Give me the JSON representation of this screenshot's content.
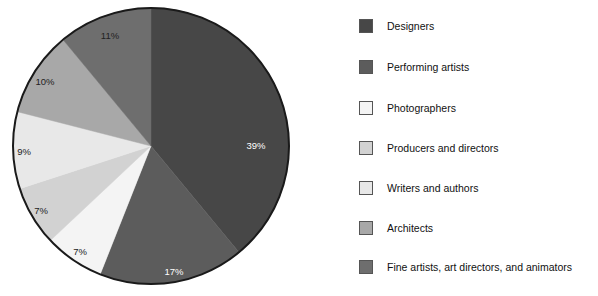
{
  "chart_data": {
    "type": "pie",
    "title": "",
    "subtitle": "",
    "xlabel": "",
    "ylabel": "",
    "legend_position": "right",
    "grid": false,
    "start_angle_deg": 0,
    "direction": "clockwise",
    "categories": [
      "Designers",
      "Performing artists",
      "Photographers",
      "Producers and directors",
      "Writers and authors",
      "Architects",
      "Fine artists, art directors, and animators"
    ],
    "values": [
      39,
      17,
      7,
      7,
      9,
      10,
      11
    ],
    "value_labels": [
      "39%",
      "17%",
      "7%",
      "7%",
      "9%",
      "10%",
      "11%"
    ],
    "colors": [
      "#474747",
      "#5c5c5c",
      "#f4f4f4",
      "#d2d2d2",
      "#e8e8e8",
      "#a8a8a8",
      "#6e6e6e"
    ],
    "label_colors": [
      "#ffffff",
      "#ffffff",
      "#222222",
      "#222222",
      "#222222",
      "#222222",
      "#222222"
    ]
  },
  "pie": {
    "outline_color": "#1a1a1a",
    "slices": [
      {
        "label": "Designers",
        "value": 39,
        "display": "39%",
        "color": "#474747",
        "text_color": "#ffffff",
        "label_x": 256,
        "label_y": 146
      },
      {
        "label": "Performing artists",
        "value": 17,
        "display": "17%",
        "color": "#5c5c5c",
        "text_color": "#ffffff",
        "label_x": 174,
        "label_y": 272
      },
      {
        "label": "Photographers",
        "value": 7,
        "display": "7%",
        "color": "#f4f4f4",
        "text_color": "#222222",
        "label_x": 80,
        "label_y": 252
      },
      {
        "label": "Producers and directors",
        "value": 7,
        "display": "7%",
        "color": "#d2d2d2",
        "text_color": "#222222",
        "label_x": 41,
        "label_y": 211
      },
      {
        "label": "Writers and authors",
        "value": 9,
        "display": "9%",
        "color": "#e8e8e8",
        "text_color": "#222222",
        "label_x": 24,
        "label_y": 152
      },
      {
        "label": "Architects",
        "value": 10,
        "display": "10%",
        "color": "#a8a8a8",
        "text_color": "#222222",
        "label_x": 45,
        "label_y": 82
      },
      {
        "label": "Fine artists, art directors, and animators",
        "value": 11,
        "display": "11%",
        "color": "#6e6e6e",
        "text_color": "#222222",
        "label_x": 110,
        "label_y": 36
      }
    ]
  },
  "legend": {
    "items": [
      {
        "label": "Designers",
        "color": "#474747",
        "y": 18
      },
      {
        "label": "Performing artists",
        "color": "#5c5c5c",
        "y": 59
      },
      {
        "label": "Photographers",
        "color": "#f4f4f4",
        "y": 100
      },
      {
        "label": "Producers and directors",
        "color": "#d2d2d2",
        "y": 140
      },
      {
        "label": "Writers and authors",
        "color": "#e8e8e8",
        "y": 180
      },
      {
        "label": "Architects",
        "color": "#a8a8a8",
        "y": 220
      },
      {
        "label": "Fine artists, art directors, and animators",
        "color": "#6e6e6e",
        "y": 259
      }
    ]
  }
}
